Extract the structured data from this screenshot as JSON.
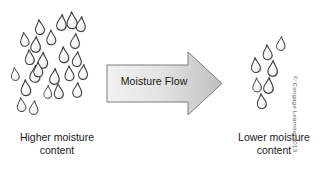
{
  "figure": {
    "background_color": "#ffffff",
    "arrow": {
      "label": "Moisture Flow",
      "direction": "right",
      "fill_start_color": "#f2f2f2",
      "fill_end_color": "#bfbfbf",
      "stroke_color": "#808080",
      "shaft": {
        "x": 107,
        "y": 65,
        "width": 95,
        "height": 37
      },
      "head": {
        "tip_x": 222,
        "top_y": 52,
        "bottom_y": 115
      }
    },
    "left_label": "Higher moisture\ncontent",
    "right_label": "Lower moisture\ncontent",
    "copyright": "© Cengage Learning 2013",
    "droplet": {
      "outline_color": "#3c3c3c",
      "fill_color": "#fbfbfb",
      "shadow_color": "#9a9a9a",
      "semantic": "water-droplet-icon"
    },
    "left_cluster": {
      "name": "high-moisture-droplet-cluster",
      "count": 22,
      "droplets": [
        {
          "x": 34,
          "y": 20,
          "size": 15,
          "rot": -6
        },
        {
          "x": 57,
          "y": 14,
          "size": 16,
          "rot": 4
        },
        {
          "x": 66,
          "y": 12,
          "size": 17,
          "rot": -3
        },
        {
          "x": 77,
          "y": 16,
          "size": 15,
          "rot": 6
        },
        {
          "x": 19,
          "y": 33,
          "size": 14,
          "rot": -8
        },
        {
          "x": 31,
          "y": 36,
          "size": 16,
          "rot": 3
        },
        {
          "x": 46,
          "y": 30,
          "size": 15,
          "rot": -2
        },
        {
          "x": 71,
          "y": 33,
          "size": 15,
          "rot": 5
        },
        {
          "x": 24,
          "y": 50,
          "size": 15,
          "rot": -5
        },
        {
          "x": 38,
          "y": 52,
          "size": 16,
          "rot": 2
        },
        {
          "x": 58,
          "y": 47,
          "size": 16,
          "rot": -4
        },
        {
          "x": 73,
          "y": 51,
          "size": 15,
          "rot": 6
        },
        {
          "x": 10,
          "y": 68,
          "size": 13,
          "rot": -7
        },
        {
          "x": 30,
          "y": 65,
          "size": 17,
          "rot": 3
        },
        {
          "x": 33,
          "y": 62,
          "size": 15,
          "rot": -2
        },
        {
          "x": 50,
          "y": 68,
          "size": 16,
          "rot": 4
        },
        {
          "x": 64,
          "y": 66,
          "size": 15,
          "rot": -3
        },
        {
          "x": 79,
          "y": 64,
          "size": 15,
          "rot": 5
        },
        {
          "x": 20,
          "y": 80,
          "size": 16,
          "rot": -4
        },
        {
          "x": 44,
          "y": 85,
          "size": 13,
          "rot": 3
        },
        {
          "x": 53,
          "y": 84,
          "size": 15,
          "rot": -5
        },
        {
          "x": 73,
          "y": 82,
          "size": 15,
          "rot": 4
        },
        {
          "x": 16,
          "y": 98,
          "size": 14,
          "rot": -6
        },
        {
          "x": 30,
          "y": 100,
          "size": 14,
          "rot": 5
        }
      ]
    },
    "right_cluster": {
      "name": "low-moisture-droplet-cluster",
      "count": 7,
      "droplets": [
        {
          "x": 277,
          "y": 36,
          "size": 14,
          "rot": 5
        },
        {
          "x": 262,
          "y": 45,
          "size": 15,
          "rot": -4
        },
        {
          "x": 250,
          "y": 58,
          "size": 15,
          "rot": -6
        },
        {
          "x": 268,
          "y": 60,
          "size": 16,
          "rot": 3
        },
        {
          "x": 252,
          "y": 78,
          "size": 14,
          "rot": -3
        },
        {
          "x": 264,
          "y": 77,
          "size": 16,
          "rot": 4
        },
        {
          "x": 256,
          "y": 94,
          "size": 15,
          "rot": -5
        }
      ]
    }
  }
}
